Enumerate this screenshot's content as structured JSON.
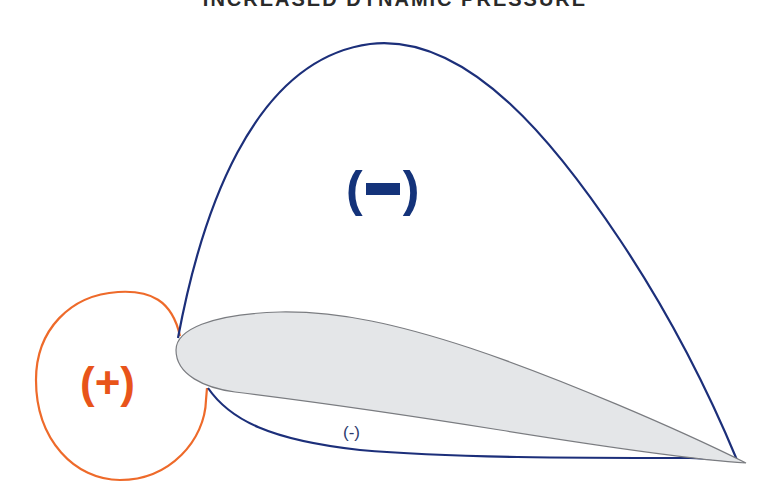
{
  "title": "INCREASED DYNAMIC PRESSURE",
  "labels": {
    "upper_region": {
      "open": "(",
      "sign": "minus",
      "close": ")"
    },
    "leading_edge_region": "(+)",
    "lower_region": "(-)"
  },
  "colors": {
    "suction_outline": "#1c2f7a",
    "pressure_outline": "#ee6a2a",
    "airfoil_fill": "#e4e6e8",
    "airfoil_stroke": "#7a7c80",
    "minus_label": "#14337a",
    "plus_label": "#e8541a"
  },
  "regions": [
    {
      "name": "upper surface low pressure",
      "sign": "-"
    },
    {
      "name": "leading edge high pressure",
      "sign": "+"
    },
    {
      "name": "lower surface low pressure",
      "sign": "-"
    }
  ]
}
